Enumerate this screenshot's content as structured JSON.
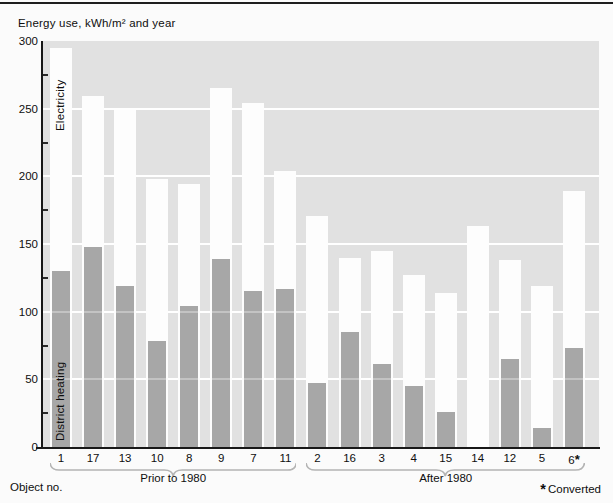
{
  "title": "Energy use, kWh/m² and year",
  "labels": {
    "object_no": "Object no.",
    "converted_note": "Converted",
    "asterisk": "*"
  },
  "colors": {
    "plot_background": "#e1e1e1",
    "district_heating_bar": "#a7a7a7",
    "electricity_bar": "#fdfdfd",
    "gridline": "#ffffff",
    "axis": "#181818"
  },
  "chart_data": {
    "type": "bar",
    "stacked": true,
    "title": "Energy use, kWh/m² and year",
    "xlabel": "Object no.",
    "ylabel": "Energy use, kWh/m² and year",
    "ylim": [
      0,
      300
    ],
    "y_ticks": [
      0,
      50,
      100,
      150,
      200,
      250,
      300
    ],
    "y_minor_tick_step": 25,
    "grid": true,
    "legend_position": "inside-first-bar",
    "categories": [
      "1",
      "17",
      "13",
      "10",
      "8",
      "9",
      "7",
      "11",
      "2",
      "16",
      "3",
      "4",
      "15",
      "14",
      "12",
      "5",
      "6*"
    ],
    "series": [
      {
        "name": "District heating",
        "values": [
          130,
          148,
          119,
          78,
          104,
          139,
          115,
          117,
          47,
          85,
          61,
          45,
          26,
          0,
          65,
          14,
          73
        ]
      },
      {
        "name": "Electricity",
        "values": [
          165,
          111,
          130,
          120,
          90,
          126,
          139,
          87,
          124,
          55,
          84,
          82,
          88,
          163,
          73,
          105,
          116
        ]
      }
    ],
    "totals": [
      295,
      259,
      249,
      198,
      194,
      265,
      254,
      204,
      171,
      140,
      145,
      127,
      114,
      163,
      138,
      119,
      189
    ],
    "groups": [
      {
        "label": "Prior to 1980",
        "from": 0,
        "to": 7
      },
      {
        "label": "After 1980",
        "from": 8,
        "to": 16
      }
    ],
    "footnote": "*Converted"
  }
}
